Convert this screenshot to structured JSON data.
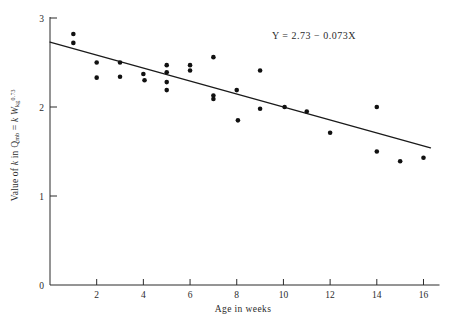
{
  "figure": {
    "background_color": "#ffffff",
    "ink_color": "#2b2b2b",
    "point_color": "#111111"
  },
  "annotations": {
    "equation": "Y  =  2.73  −  0.073X"
  },
  "labels": {
    "xlabel": "Age in weeks",
    "ylabel_plain": "Value of k in Qmb = k Wkg0.73",
    "ylabel_parts": {
      "prefix": "Value of ",
      "k1": "k",
      "mid": " in ",
      "q": "Q",
      "q_sub": "mb",
      "eq": " = ",
      "k2": "k",
      "w": " W",
      "w_sub": "kg",
      "w_sup": "0.73"
    }
  },
  "chart_data": {
    "type": "scatter",
    "title": "",
    "xlabel": "Age in weeks",
    "ylabel": "Value of k in Qmb = k Wkg0.73",
    "xlim": [
      0,
      16.6
    ],
    "ylim": [
      0,
      3
    ],
    "xticks": [
      2,
      4,
      6,
      8,
      10,
      12,
      14,
      16
    ],
    "xtick_labels": [
      "2",
      "4",
      "6",
      "8",
      "10",
      "12",
      "14",
      "16"
    ],
    "yticks": [
      0,
      1,
      2,
      3
    ],
    "ytick_labels": [
      "0",
      "1",
      "2",
      "3"
    ],
    "grid": false,
    "legend": null,
    "points": [
      {
        "x": 1.0,
        "y": 2.82
      },
      {
        "x": 1.0,
        "y": 2.72
      },
      {
        "x": 2.0,
        "y": 2.5
      },
      {
        "x": 2.0,
        "y": 2.33
      },
      {
        "x": 3.0,
        "y": 2.5
      },
      {
        "x": 3.0,
        "y": 2.34
      },
      {
        "x": 4.0,
        "y": 2.37
      },
      {
        "x": 4.05,
        "y": 2.3
      },
      {
        "x": 5.0,
        "y": 2.47
      },
      {
        "x": 5.0,
        "y": 2.39
      },
      {
        "x": 5.0,
        "y": 2.28
      },
      {
        "x": 5.0,
        "y": 2.19
      },
      {
        "x": 6.0,
        "y": 2.47
      },
      {
        "x": 6.0,
        "y": 2.41
      },
      {
        "x": 7.0,
        "y": 2.56
      },
      {
        "x": 7.0,
        "y": 2.13
      },
      {
        "x": 7.0,
        "y": 2.09
      },
      {
        "x": 8.0,
        "y": 2.19
      },
      {
        "x": 8.05,
        "y": 1.85
      },
      {
        "x": 9.0,
        "y": 2.41
      },
      {
        "x": 9.0,
        "y": 1.98
      },
      {
        "x": 10.05,
        "y": 2.0
      },
      {
        "x": 11.0,
        "y": 1.95
      },
      {
        "x": 12.0,
        "y": 1.71
      },
      {
        "x": 14.0,
        "y": 2.0
      },
      {
        "x": 14.0,
        "y": 1.5
      },
      {
        "x": 15.0,
        "y": 1.39
      },
      {
        "x": 16.0,
        "y": 1.43
      }
    ],
    "fit_line": {
      "equation": "Y = 2.73 - 0.073X",
      "intercept": 2.73,
      "slope": -0.073,
      "x_start": 0.0,
      "x_end": 16.3
    }
  }
}
